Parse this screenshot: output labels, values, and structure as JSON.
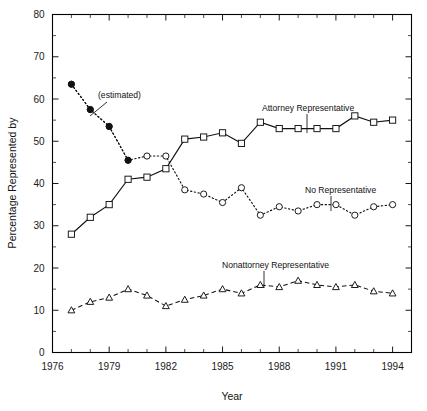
{
  "chart_data": {
    "type": "line",
    "title": "",
    "xlabel": "Year",
    "ylabel": "Percentage Represented by",
    "xlim": [
      1976,
      1995
    ],
    "ylim": [
      0,
      80
    ],
    "grid": false,
    "legend": "annotations-inline",
    "x_ticks": [
      1976,
      1979,
      1982,
      1985,
      1988,
      1991,
      1994
    ],
    "x_tick_labels": [
      "1976",
      "1979",
      "1982",
      "1985",
      "1988",
      "1991",
      "1994"
    ],
    "x_minor_step": 1,
    "y_ticks": [
      0,
      10,
      20,
      30,
      40,
      50,
      60,
      70,
      80
    ],
    "y_tick_labels": [
      "0",
      "10",
      "20",
      "30",
      "40",
      "50",
      "60",
      "70",
      "80"
    ],
    "y_minor_step": 5,
    "x": [
      1977,
      1978,
      1979,
      1980,
      1981,
      1982,
      1983,
      1984,
      1985,
      1986,
      1987,
      1988,
      1989,
      1990,
      1991,
      1992,
      1993,
      1994
    ],
    "series": [
      {
        "name": "Attorney Representative",
        "marker": "open-square",
        "linestyle": "solid",
        "values": [
          28.0,
          32.0,
          35.0,
          41.0,
          41.5,
          43.5,
          50.5,
          51.0,
          52.0,
          49.5,
          54.5,
          53.0,
          53.0,
          53.0,
          53.0,
          56.0,
          54.5,
          55.0
        ]
      },
      {
        "name": "No Representative",
        "marker": "open-circle",
        "linestyle": "dotted",
        "values": [
          63.5,
          57.5,
          53.5,
          45.5,
          46.5,
          46.5,
          38.5,
          37.5,
          35.5,
          39.0,
          32.5,
          34.5,
          33.5,
          35.0,
          35.0,
          32.5,
          34.5,
          35.0
        ]
      },
      {
        "name": "Nonattorney Representative",
        "marker": "open-triangle",
        "linestyle": "dashed",
        "values": [
          10.0,
          12.0,
          13.0,
          15.0,
          13.5,
          11.0,
          12.5,
          13.5,
          15.0,
          14.0,
          16.0,
          15.5,
          17.0,
          16.0,
          15.5,
          16.0,
          14.5,
          14.0
        ]
      }
    ],
    "estimated_segment": {
      "series": "No Representative",
      "marker": "filled-circle",
      "x": [
        1977,
        1978,
        1979,
        1980
      ],
      "values": [
        63.5,
        57.5,
        53.5,
        45.5
      ],
      "note": "(estimated)"
    },
    "annotations": [
      {
        "id": "estimated",
        "text": "(estimated)",
        "points_to": [
          1979.0,
          54.5
        ]
      },
      {
        "id": "attorney",
        "text": "Attorney Representative",
        "points_to": [
          1989.0,
          53.0
        ]
      },
      {
        "id": "no-rep",
        "text": "No Representative",
        "points_to": [
          1990.2,
          35.0
        ]
      },
      {
        "id": "nonattorney",
        "text": "Nonattorney Representative",
        "points_to": [
          1988.0,
          15.6
        ]
      }
    ]
  },
  "axis": {
    "x_title": "Year",
    "y_title": "Percentage Represented by"
  },
  "colors": {
    "ink": "#111111",
    "background": "#ffffff"
  }
}
